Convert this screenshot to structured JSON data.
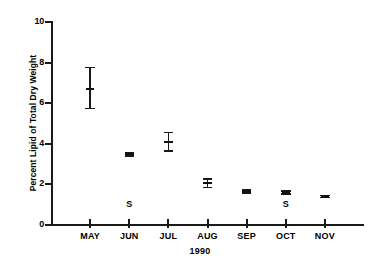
{
  "chart_data": {
    "type": "scatter",
    "title": "",
    "xlabel": "1990",
    "ylabel": "Percent Lipid of Total Dry Weight",
    "categories": [
      "MAY",
      "JUN",
      "JUL",
      "AUG",
      "SEP",
      "OCT",
      "NOV"
    ],
    "values": [
      6.7,
      3.5,
      4.1,
      2.05,
      1.65,
      1.6,
      1.4
    ],
    "error_low": [
      5.7,
      3.35,
      3.6,
      1.8,
      1.55,
      1.5,
      1.32
    ],
    "error_high": [
      7.8,
      3.62,
      4.6,
      2.3,
      1.78,
      1.7,
      1.5
    ],
    "ylim": [
      0,
      10
    ],
    "yticks": [
      0,
      2,
      4,
      6,
      8,
      10
    ],
    "ytick_labels": [
      "0",
      "2",
      "4",
      "6",
      "8",
      "10"
    ],
    "grid": false,
    "legend": "none",
    "annotations": [
      {
        "label": "S",
        "category": "JUN",
        "value": 1.0
      },
      {
        "label": "S",
        "category": "OCT",
        "value": 1.0
      }
    ],
    "series_name": "Percent Lipid of Total Dry Weight",
    "marker_style": "mean-with-error-bar",
    "color": "#1a1a1a"
  },
  "axis": {
    "y_title": "Percent Lipid of Total Dry Weight",
    "x_title": "1990",
    "y_labels": [
      "10",
      "8",
      "6",
      "4",
      "2",
      "0"
    ],
    "x_labels": [
      "MAY",
      "JUN",
      "JUL",
      "AUG",
      "SEP",
      "OCT",
      "NOV"
    ]
  },
  "annotations": {
    "s_jun": "S",
    "s_oct": "S"
  }
}
